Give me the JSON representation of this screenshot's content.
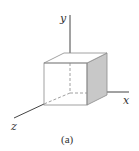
{
  "figure": {
    "caption": "(a)",
    "axes": {
      "x_label": "x",
      "y_label": "y",
      "z_label": "z"
    },
    "object": "cube",
    "colors": {
      "line": "#8a8a8a",
      "axis": "#444444",
      "shaded_face": "#c8c8c8"
    }
  }
}
